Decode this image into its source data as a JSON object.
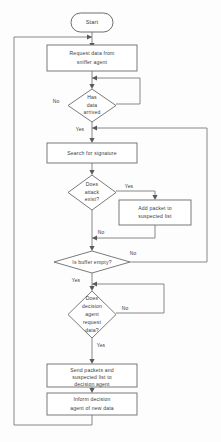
{
  "diagram": {
    "type": "flowchart",
    "colors": {
      "background": "#fdfdfd",
      "node_fill": "#ffffff",
      "node_stroke": "#6b6b6b",
      "line": "#7a7a7a",
      "text": "#3a3a3a"
    },
    "nodes": {
      "start": {
        "shape": "terminator",
        "label": "Start"
      },
      "request_data": {
        "shape": "process",
        "line1": "Request data from",
        "line2": "sniffer agent"
      },
      "has_data": {
        "shape": "decision",
        "line1": "Has",
        "line2": "data",
        "line3": "arrived"
      },
      "search_signature": {
        "shape": "process",
        "line1": "Search for signature"
      },
      "attack_exist": {
        "shape": "decision",
        "line1": "Does",
        "line2": "attack",
        "line3": "exist?"
      },
      "add_packet": {
        "shape": "process",
        "line1": "Add packet to",
        "line2": "suspected list"
      },
      "buffer_empty": {
        "shape": "decision",
        "line1": "Is buffer empty?"
      },
      "agent_request": {
        "shape": "decision",
        "line1": "Does",
        "line2": "decision",
        "line3": "agent",
        "line4": "request",
        "line5": "data?"
      },
      "send_packets": {
        "shape": "process",
        "line1": "Send packets and",
        "line2": "suspected list to",
        "line3": "decision agent"
      },
      "inform_agent": {
        "shape": "process",
        "line1": "Inform decision",
        "line2": "agent of new data"
      }
    },
    "edge_labels": {
      "has_data_no": "No",
      "has_data_yes": "Yes",
      "attack_yes": "Yes",
      "attack_no": "No",
      "buffer_no": "No",
      "buffer_yes": "Yes",
      "agent_no": "No",
      "agent_yes": "Yes"
    }
  }
}
